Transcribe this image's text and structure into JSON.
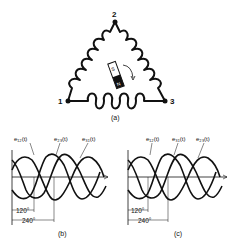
{
  "figure_a": {
    "caption": "(a)",
    "nodes": [
      {
        "id": "1",
        "label": "1"
      },
      {
        "id": "2",
        "label": "2"
      },
      {
        "id": "3",
        "label": "3"
      }
    ],
    "magnet": {
      "south_label": "S",
      "north_label": "N",
      "rotation": "clockwise"
    }
  },
  "figure_b": {
    "caption": "(b)",
    "wave_labels": [
      "e₁₂(t)",
      "e₂₃(t)",
      "e₃₁(t)"
    ],
    "dim_120": "120°",
    "dim_240": "240°"
  },
  "figure_c": {
    "caption": "(c)",
    "wave_labels": [
      "e₁₂(t)",
      "e₃₁(t)",
      "e₂₃(t)"
    ],
    "dim_120": "120°",
    "dim_240": "240°"
  },
  "colors": {
    "ink": "#111111",
    "background": "#ffffff"
  }
}
